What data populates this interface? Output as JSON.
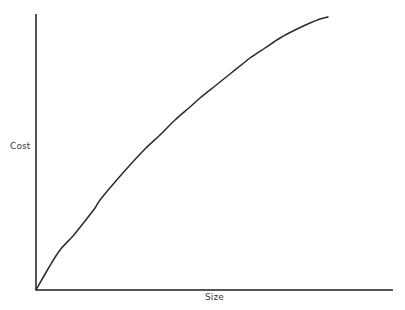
{
  "figure": {
    "width": 405,
    "height": 310,
    "background_color": "#ffffff"
  },
  "chart_data": {
    "type": "line",
    "title": "",
    "subtitle": "",
    "xlabel": "Size",
    "ylabel": "Cost",
    "grid": false,
    "legend": null,
    "annotations": [],
    "axis_color": "#555555",
    "line_color": "#2a2a2a",
    "line_width": 1.5,
    "axes": {
      "origin_px": [
        36,
        290
      ],
      "y_axis_top_px": [
        36,
        14
      ],
      "x_axis_right_px": [
        393,
        290
      ],
      "xlim": [
        0,
        1
      ],
      "ylim": [
        0,
        1
      ],
      "ticks": [],
      "tick_labels": []
    },
    "series": [
      {
        "name": "cost-vs-size",
        "points_px": [
          [
            36,
            290
          ],
          [
            48,
            269
          ],
          [
            60,
            250
          ],
          [
            73,
            236
          ],
          [
            85,
            221
          ],
          [
            95,
            208
          ],
          [
            100,
            200
          ],
          [
            115,
            182
          ],
          [
            130,
            165
          ],
          [
            145,
            149
          ],
          [
            160,
            135
          ],
          [
            175,
            120
          ],
          [
            190,
            107
          ],
          [
            200,
            98
          ],
          [
            215,
            86
          ],
          [
            230,
            74
          ],
          [
            245,
            62
          ],
          [
            250,
            58
          ],
          [
            265,
            48
          ],
          [
            280,
            38
          ],
          [
            295,
            30
          ],
          [
            310,
            23
          ],
          [
            320,
            19
          ],
          [
            328,
            17
          ]
        ],
        "x": [
          0.0,
          0.03,
          0.07,
          0.1,
          0.14,
          0.17,
          0.18,
          0.22,
          0.26,
          0.31,
          0.35,
          0.39,
          0.43,
          0.46,
          0.5,
          0.54,
          0.59,
          0.6,
          0.64,
          0.68,
          0.73,
          0.77,
          0.8,
          0.82
        ],
        "y": [
          0.0,
          0.08,
          0.14,
          0.2,
          0.25,
          0.3,
          0.33,
          0.39,
          0.45,
          0.51,
          0.56,
          0.62,
          0.66,
          0.7,
          0.74,
          0.78,
          0.83,
          0.84,
          0.88,
          0.91,
          0.94,
          0.97,
          0.98,
          0.99
        ]
      }
    ]
  },
  "labels": {
    "y_axis": "Cost",
    "x_axis": "Size"
  }
}
